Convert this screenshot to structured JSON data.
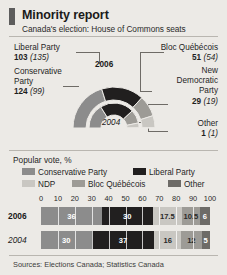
{
  "header": {
    "title": "Minority report",
    "subtitle": "Canada's election: House of Commons seats"
  },
  "colors": {
    "background": "#eceae6",
    "conservative": "#8c8c8c",
    "liberal": "#211f1f",
    "ndp": "#c9c7c2",
    "bloc": "#9d9b96",
    "other": "#6d6b67",
    "accent": "#5d5d5d"
  },
  "seats": {
    "note": "2006 seats with 2004 in parentheses",
    "liberal": {
      "party": "Liberal Party",
      "value": "103",
      "previous": "(135)"
    },
    "conservative": {
      "party": "Conservative Party",
      "value": "124",
      "previous": "(99)"
    },
    "bloc": {
      "party": "Bloc Québécois",
      "value": "51",
      "previous": "(54)"
    },
    "ndp": {
      "party": "New Democratic Party",
      "value": "29",
      "previous": "(19)"
    },
    "other": {
      "party": "Other",
      "value": "1",
      "previous": "(1)"
    }
  },
  "donut": {
    "outer_year": "2006",
    "inner_year": "2004"
  },
  "popular_vote": {
    "title": "Popular vote, %",
    "legend": [
      {
        "key": "conservative",
        "label": "Conservative Party"
      },
      {
        "key": "liberal",
        "label": "Liberal Party"
      },
      {
        "key": "ndp",
        "label": "NDP"
      },
      {
        "key": "bloc",
        "label": "Bloc Québécois"
      },
      {
        "key": "other",
        "label": "Other"
      }
    ]
  },
  "source": "Sources: Elections Canada; Statistics Canada",
  "chart_data": [
    {
      "type": "pie",
      "title": "House of Commons seats 2006 (outer ring)",
      "categories": [
        "Conservative Party",
        "Liberal Party",
        "Bloc Québécois",
        "New Democratic Party",
        "Other"
      ],
      "values": [
        124,
        103,
        51,
        29,
        1
      ],
      "total": 308,
      "layout": "semicircular donut, outer ring"
    },
    {
      "type": "pie",
      "title": "House of Commons seats 2004 (inner ring)",
      "categories": [
        "Conservative Party",
        "Liberal Party",
        "Bloc Québécois",
        "New Democratic Party",
        "Other"
      ],
      "values": [
        99,
        135,
        54,
        19,
        1
      ],
      "total": 308,
      "layout": "semicircular donut, inner ring"
    },
    {
      "type": "bar",
      "title": "Popular vote, %",
      "orientation": "horizontal-stacked",
      "categories": [
        "2006",
        "2004"
      ],
      "series": [
        {
          "name": "Conservative Party",
          "values": [
            36,
            30
          ]
        },
        {
          "name": "Liberal Party",
          "values": [
            30,
            37
          ]
        },
        {
          "name": "NDP",
          "values": [
            17.5,
            16
          ]
        },
        {
          "name": "Bloc Québécois",
          "values": [
            10.5,
            12
          ]
        },
        {
          "name": "Other",
          "values": [
            6,
            5
          ]
        }
      ],
      "xlabel": "",
      "ylabel": "",
      "xlim": [
        0,
        100
      ],
      "xticks": [
        0,
        10,
        20,
        30,
        40,
        50,
        60,
        70,
        80,
        90,
        100
      ],
      "grid": true,
      "legend_position": "top"
    }
  ]
}
